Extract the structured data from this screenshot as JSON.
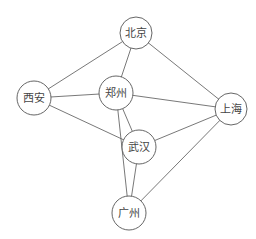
{
  "diagram": {
    "type": "undirected-graph",
    "nodes": [
      {
        "id": "beijing",
        "label": "北京",
        "x": 136,
        "y": 33,
        "r": 16
      },
      {
        "id": "xian",
        "label": "西安",
        "x": 34,
        "y": 98,
        "r": 17
      },
      {
        "id": "zhengzhou",
        "label": "郑州",
        "x": 116,
        "y": 93,
        "r": 17
      },
      {
        "id": "shanghai",
        "label": "上海",
        "x": 231,
        "y": 109,
        "r": 16
      },
      {
        "id": "wuhan",
        "label": "武汉",
        "x": 139,
        "y": 147,
        "r": 17
      },
      {
        "id": "guangzhou",
        "label": "广州",
        "x": 129,
        "y": 213,
        "r": 17
      }
    ],
    "edges": [
      {
        "from": "beijing",
        "to": "xian"
      },
      {
        "from": "beijing",
        "to": "zhengzhou"
      },
      {
        "from": "beijing",
        "to": "shanghai"
      },
      {
        "from": "xian",
        "to": "zhengzhou"
      },
      {
        "from": "xian",
        "to": "wuhan"
      },
      {
        "from": "zhengzhou",
        "to": "shanghai"
      },
      {
        "from": "zhengzhou",
        "to": "wuhan"
      },
      {
        "from": "zhengzhou",
        "to": "guangzhou"
      },
      {
        "from": "wuhan",
        "to": "shanghai"
      },
      {
        "from": "wuhan",
        "to": "guangzhou"
      },
      {
        "from": "guangzhou",
        "to": "shanghai"
      }
    ],
    "colors": {
      "stroke": "#555555",
      "fill": "#ffffff",
      "text": "#444444"
    }
  }
}
